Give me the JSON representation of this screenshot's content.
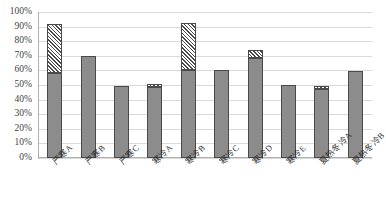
{
  "chart_data": {
    "type": "bar",
    "title": "",
    "xlabel": "",
    "ylabel": "",
    "ylim": [
      0,
      1
    ],
    "grid": true,
    "legend": "none",
    "stacked": true,
    "categories": [
      "严寒A",
      "严寒B",
      "严寒C",
      "寒冷A",
      "寒冷B",
      "寒冷C",
      "寒冷D",
      "寒冷E",
      "夏热冬冷A",
      "夏热冬冷B"
    ],
    "ytick_labels": [
      "0%",
      "10%",
      "20%",
      "30%",
      "40%",
      "50%",
      "60%",
      "70%",
      "80%",
      "90%",
      "100%"
    ],
    "ytick_values": [
      0,
      0.1,
      0.2,
      0.3,
      0.4,
      0.5,
      0.6,
      0.7,
      0.8,
      0.9,
      1.0
    ],
    "series": [
      {
        "name": "solid-segment",
        "style": "solid-gray",
        "color": "#8c8c8c",
        "values": [
          0.58,
          0.7,
          0.495,
          0.485,
          0.6,
          0.6,
          0.685,
          0.5,
          0.475,
          0.595
        ]
      },
      {
        "name": "hatched-segment",
        "style": "diagonal-hatch",
        "color": "#ffffff",
        "values": [
          0.335,
          0.0,
          0.0,
          0.025,
          0.325,
          0.0,
          0.055,
          0.0,
          0.015,
          0.0
        ]
      }
    ],
    "totals": [
      0.915,
      0.7,
      0.495,
      0.51,
      0.925,
      0.6,
      0.74,
      0.5,
      0.49,
      0.595
    ]
  },
  "colors": {
    "bar_solid": "#8c8c8c",
    "bar_outline": "#4a4a4a",
    "gridline": "#d9d9d9",
    "axis": "#b0b0b0",
    "text": "#3f3f3f",
    "background": "#ffffff"
  }
}
